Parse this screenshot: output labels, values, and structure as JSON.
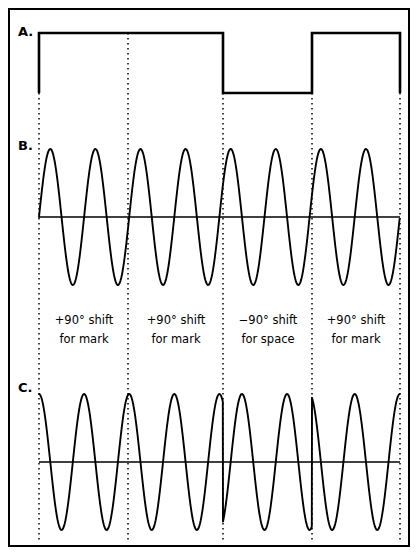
{
  "figure": {
    "width": 418,
    "height": 559,
    "background_color": "#ffffff",
    "line_color": "#000000",
    "border_color": "#000000"
  },
  "traces": [
    {
      "id": "A",
      "label": "A.",
      "name": "digital-data-signal",
      "type": "square",
      "description": "Binary NRZ data signal",
      "baseline_y": 93,
      "high_y": 33,
      "x_start": 39,
      "x_end": 400,
      "levels": [
        {
          "from": 39,
          "to": 223,
          "state": "high",
          "bit": "mark"
        },
        {
          "from": 223,
          "to": 312,
          "state": "low",
          "bit": "space"
        },
        {
          "from": 312,
          "to": 400,
          "state": "high",
          "bit": "mark"
        }
      ]
    },
    {
      "id": "B",
      "label": "B.",
      "name": "reference-carrier-wave",
      "type": "sine",
      "description": "Unmodulated reference carrier",
      "axis_y": 217,
      "amplitude": 68,
      "period": 45.1,
      "phase_deg": 0,
      "cycles": 8,
      "x_start": 39,
      "x_end": 400
    },
    {
      "id": "C",
      "label": "C.",
      "name": "phase-modulated-output-wave",
      "type": "sine",
      "description": "Phase shift keyed carrier output",
      "axis_y": 462,
      "amplitude": 68,
      "period": 45.1,
      "x_start": 39,
      "x_end": 400,
      "segments": [
        {
          "from": 39,
          "to": 128,
          "phase_deg": 90
        },
        {
          "from": 128,
          "to": 223,
          "phase_deg": 90
        },
        {
          "from": 223,
          "to": 312,
          "phase_deg": -90
        },
        {
          "from": 312,
          "to": 400,
          "phase_deg": 90
        }
      ]
    }
  ],
  "bit_boundaries": [
    {
      "x": 39
    },
    {
      "x": 128
    },
    {
      "x": 223
    },
    {
      "x": 312
    },
    {
      "x": 400
    }
  ],
  "annotations": [
    {
      "center_x": 84,
      "line1": "+90° shift",
      "line2": "for mark"
    },
    {
      "center_x": 176,
      "line1": "+90° shift",
      "line2": "for mark"
    },
    {
      "center_x": 268,
      "line1": "−90° shift",
      "line2": "for space"
    },
    {
      "center_x": 356,
      "line1": "+90° shift",
      "line2": "for mark"
    }
  ],
  "annotation_lines": {
    "line1_y": 324,
    "line2_y": 343
  },
  "frame": {
    "x": 9,
    "y": 9,
    "width": 400,
    "height": 537
  }
}
